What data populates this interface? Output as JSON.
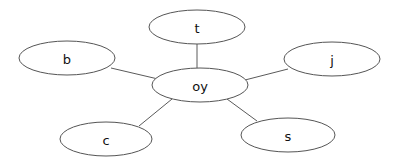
{
  "diagram": {
    "type": "node-link-graph",
    "layout": "star",
    "width": 396,
    "height": 163,
    "background_color": "#ffffff",
    "node_fill_color": "#ffffff",
    "node_stroke_color": "#555555",
    "edge_color": "#5a5a5a",
    "label_color": "#111111",
    "nodes": [
      {
        "id": "t",
        "label": "t",
        "role": "leaf",
        "position": "top",
        "cx": 197,
        "cy": 27,
        "rx": 48,
        "ry": 17,
        "font_size": 13
      },
      {
        "id": "b",
        "label": "b",
        "role": "leaf",
        "position": "upper-left",
        "cx": 67,
        "cy": 58,
        "rx": 48,
        "ry": 17,
        "font_size": 13
      },
      {
        "id": "j",
        "label": "j",
        "role": "leaf",
        "position": "upper-right",
        "cx": 332,
        "cy": 59,
        "rx": 48,
        "ry": 17,
        "font_size": 13
      },
      {
        "id": "oy",
        "label": "oy",
        "role": "center",
        "position": "center",
        "cx": 200,
        "cy": 85,
        "rx": 48,
        "ry": 17,
        "font_size": 13
      },
      {
        "id": "c",
        "label": "c",
        "role": "leaf",
        "position": "lower-left",
        "cx": 106,
        "cy": 139,
        "rx": 46,
        "ry": 17,
        "font_size": 13
      },
      {
        "id": "s",
        "label": "s",
        "role": "leaf",
        "position": "lower-right",
        "cx": 288,
        "cy": 135,
        "rx": 47,
        "ry": 17,
        "font_size": 13
      }
    ],
    "edges": [
      {
        "id": "edge-oy-t",
        "source": "oy",
        "target": "t",
        "x1": 197,
        "y1": 68,
        "x2": 197,
        "y2": 44
      },
      {
        "id": "edge-oy-b",
        "source": "oy",
        "target": "b",
        "x1": 158,
        "y1": 79,
        "x2": 111,
        "y2": 68
      },
      {
        "id": "edge-oy-j",
        "source": "oy",
        "target": "j",
        "x1": 245,
        "y1": 80,
        "x2": 288,
        "y2": 69
      },
      {
        "id": "edge-oy-c",
        "source": "oy",
        "target": "c",
        "x1": 172,
        "y1": 99,
        "x2": 139,
        "y2": 126
      },
      {
        "id": "edge-oy-s",
        "source": "oy",
        "target": "s",
        "x1": 227,
        "y1": 99,
        "x2": 257,
        "y2": 121
      }
    ]
  }
}
